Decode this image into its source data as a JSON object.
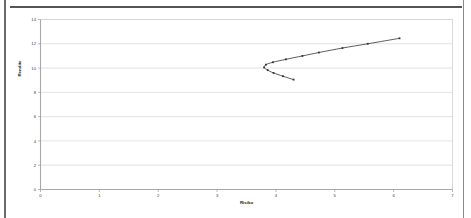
{
  "chart_data": {
    "type": "line",
    "title": "",
    "xlabel": "Risiko",
    "ylabel": "Rendite",
    "xlim": [
      0,
      7
    ],
    "ylim": [
      0,
      14
    ],
    "xticks": [
      "0",
      "1",
      "2",
      "3",
      "4",
      "5",
      "6",
      "7"
    ],
    "yticks": [
      "0",
      "2",
      "4",
      "6",
      "8",
      "10",
      "12",
      "14"
    ],
    "grid": "horizontal",
    "legend": "none",
    "marker": "square",
    "series": [
      {
        "name": "Efficient frontier",
        "color": "#333333",
        "points": [
          {
            "x": 4.3,
            "y": 9.05
          },
          {
            "x": 4.12,
            "y": 9.33
          },
          {
            "x": 3.96,
            "y": 9.6
          },
          {
            "x": 3.86,
            "y": 9.83
          },
          {
            "x": 3.8,
            "y": 10.05
          },
          {
            "x": 3.83,
            "y": 10.28
          },
          {
            "x": 3.95,
            "y": 10.48
          },
          {
            "x": 4.17,
            "y": 10.72
          },
          {
            "x": 4.45,
            "y": 11.0
          },
          {
            "x": 4.73,
            "y": 11.28
          },
          {
            "x": 5.13,
            "y": 11.65
          },
          {
            "x": 5.56,
            "y": 12.0
          },
          {
            "x": 6.1,
            "y": 12.45
          }
        ]
      }
    ]
  },
  "figure": {
    "axis_x_title": "Risiko",
    "axis_y_title": "Rendite"
  }
}
